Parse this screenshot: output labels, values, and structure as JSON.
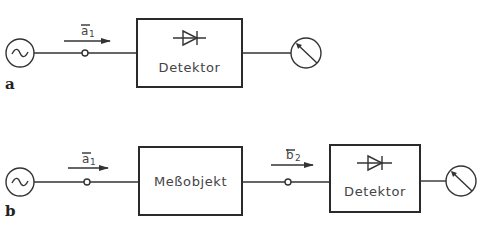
{
  "diagram": {
    "type": "block-diagram",
    "panels": [
      {
        "label": "a",
        "wave": {
          "main": "a",
          "sub": "1"
        },
        "blocks": [
          {
            "name": "detector",
            "label": "Detektor",
            "icon": "diode-icon"
          }
        ],
        "source_icon": "ac-source-icon",
        "meter_icon": "meter-icon"
      },
      {
        "label": "b",
        "wave_in": {
          "main": "a",
          "sub": "1"
        },
        "wave_out": {
          "main": "b",
          "sub": "2"
        },
        "blocks": [
          {
            "name": "dut",
            "label": "Meßobjekt"
          },
          {
            "name": "detector",
            "label": "Detektor",
            "icon": "diode-icon"
          }
        ],
        "source_icon": "ac-source-icon",
        "meter_icon": "meter-icon"
      }
    ],
    "colors": {
      "stroke": "#333333",
      "text": "#444444",
      "background": "#ffffff"
    }
  }
}
